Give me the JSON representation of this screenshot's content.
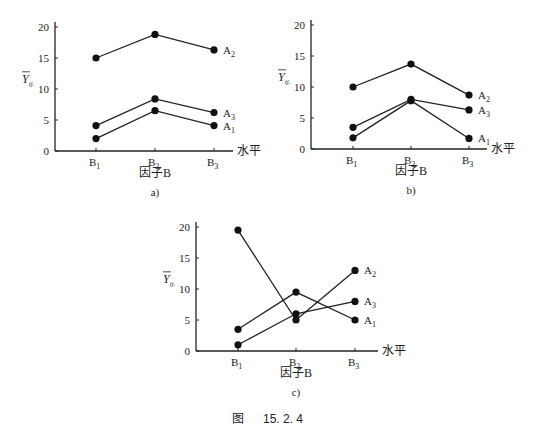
{
  "figure_caption": {
    "prefix": "图",
    "number": "15. 2. 4"
  },
  "chart_data": [
    {
      "type": "line",
      "panel": "a)",
      "ylabel": "Ȳij.",
      "xlabel": "因子B",
      "x_axis_suffix": "水平",
      "categories": [
        "B1",
        "B2",
        "B3"
      ],
      "yticks": [
        0,
        5,
        10,
        15,
        20
      ],
      "ylim": [
        0,
        20
      ],
      "series": [
        {
          "name": "A1",
          "values": [
            2,
            6.5,
            4.1
          ]
        },
        {
          "name": "A2",
          "values": [
            15,
            18.8,
            16.3
          ]
        },
        {
          "name": "A3",
          "values": [
            4.1,
            8.4,
            6.2
          ]
        }
      ]
    },
    {
      "type": "line",
      "panel": "b)",
      "ylabel": "Ȳij.",
      "xlabel": "因子B",
      "x_axis_suffix": "水平",
      "categories": [
        "B1",
        "B2",
        "B3"
      ],
      "yticks": [
        0,
        5,
        10,
        15,
        20
      ],
      "ylim": [
        0,
        20
      ],
      "series": [
        {
          "name": "A1",
          "values": [
            1.8,
            7.8,
            1.7
          ]
        },
        {
          "name": "A2",
          "values": [
            10,
            13.7,
            8.7
          ]
        },
        {
          "name": "A3",
          "values": [
            3.5,
            8,
            6.3
          ]
        }
      ]
    },
    {
      "type": "line",
      "panel": "c)",
      "ylabel": "Ȳij.",
      "xlabel": "因子B",
      "x_axis_suffix": "水平",
      "categories": [
        "B1",
        "B2",
        "B3"
      ],
      "yticks": [
        0,
        5,
        10,
        15,
        20
      ],
      "ylim": [
        0,
        20
      ],
      "series": [
        {
          "name": "A1",
          "values": [
            3.5,
            9.5,
            5
          ]
        },
        {
          "name": "A2",
          "values": [
            19.5,
            5,
            13
          ]
        },
        {
          "name": "A3",
          "values": [
            1,
            6,
            8
          ]
        }
      ]
    }
  ],
  "layout": [
    {
      "ox": 55,
      "y0": 151,
      "y20": 27,
      "xs": [
        96,
        155,
        214
      ],
      "xend": 233,
      "ytop": 22,
      "panel_x": 155,
      "panel_y": 196,
      "xlabel_y": 177
    },
    {
      "ox": 311,
      "y0": 149,
      "y20": 25,
      "xs": [
        353,
        411,
        469
      ],
      "xend": 487,
      "ytop": 20,
      "panel_x": 411,
      "panel_y": 194,
      "xlabel_y": 175
    },
    {
      "ox": 196,
      "y0": 351,
      "y20": 227,
      "xs": [
        238,
        296,
        355
      ],
      "xend": 378,
      "ytop": 222,
      "panel_x": 296,
      "panel_y": 396,
      "xlabel_y": 377
    }
  ]
}
